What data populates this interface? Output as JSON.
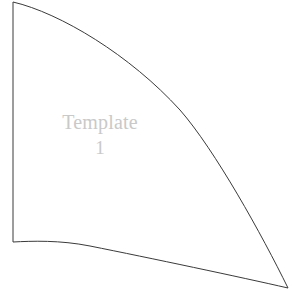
{
  "page": {
    "background_color": "#ffffff",
    "width": 304,
    "height": 306
  },
  "shape": {
    "name": "template-1-outline",
    "kind": "curved-triangular-template-piece",
    "stroke_color": "#3a3a3a",
    "fill_color": "#ffffff",
    "stroke_width": 1,
    "path": "M 13 2 C 60 13 130 55 180 110 C 215 150 262 235 288 288 C 240 277 150 258 90 246 C 60 240 32 241 13 242 Z",
    "vertices": {
      "top_left": [
        13,
        2
      ],
      "bottom_left": [
        13,
        242
      ],
      "right_tip": [
        288,
        288
      ]
    }
  },
  "label": {
    "text_line_1": "Template",
    "text_line_2": "1",
    "color": "#c9c9c9"
  }
}
